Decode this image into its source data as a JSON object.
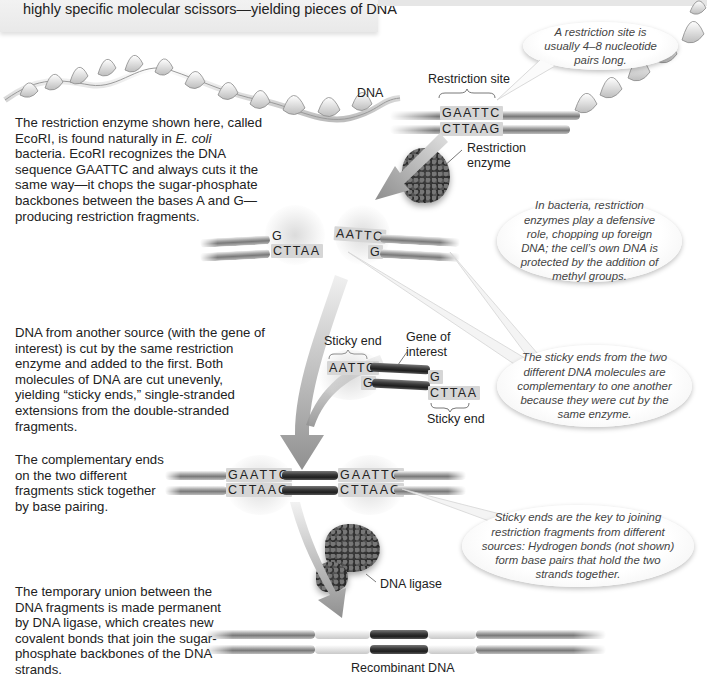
{
  "header": {
    "text": "highly specific molecular scissors—yielding pieces of DNA"
  },
  "callouts": {
    "restriction_site_length": "A restriction site is usually 4–8 nucleotide pairs long.",
    "bacteria_defense": "In bacteria, restriction enzymes play a defensive role, chopping up foreign DNA; the cell’s own DNA is protected by the addition of methyl groups.",
    "complementary_sticky_ends": "The sticky ends from the two different DNA molecules are complementary to one another because they were cut by the same enzyme.",
    "key_to_joining": "Sticky ends are the key to joining restriction fragments from different sources: Hydrogen bonds (not shown) form base pairs that hold the two strands together."
  },
  "steps": [
    {
      "id": 1,
      "text_before_italic": "The restriction enzyme shown here, called EcoRI, is found naturally in ",
      "italic": "E. coli",
      "text_after_italic": " bacteria. EcoRI recognizes the DNA sequence GAATTC and always cuts it the same way—it chops the sugar-phosphate backbones between the bases A and G—producing restriction fragments."
    },
    {
      "id": 2,
      "text": "DNA from another source (with the gene of interest) is cut by the same restriction enzyme and added to the first. Both molecules of DNA are cut unevenly, yielding “sticky ends,” single-stranded extensions from the double-stranded fragments."
    },
    {
      "id": 3,
      "text": "The complementary ends on the two different fragments stick together by base pairing."
    },
    {
      "id": 4,
      "text": "The temporary union between the DNA fragments is made permanent by DNA ligase, which creates new covalent bonds that join the sugar-phosphate backbones of the DNA strands."
    }
  ],
  "labels": {
    "dna": "DNA",
    "restriction_site": "Restriction site",
    "restriction_enzyme_line1": "Restriction",
    "restriction_enzyme_line2": "enzyme",
    "sticky_end_top": "Sticky end",
    "sticky_end_bottom": "Sticky end",
    "gene_of_interest_line1": "Gene of",
    "gene_of_interest_line2": "interest",
    "dna_ligase": "DNA ligase",
    "recombinant_dna": "Recombinant DNA"
  },
  "sequences": {
    "site_top": "GAATTC",
    "site_bottom": "CTTAAG",
    "cut_left_top": "G",
    "cut_left_bottom": "CTTAA",
    "cut_right_top": "AATTC",
    "cut_right_bottom": "G",
    "gene_left_top": "AATTC",
    "gene_left_bottom": "G",
    "gene_right_top": "G",
    "gene_right_bottom": "CTTAA",
    "joined_left_top": "GAATTC",
    "joined_left_bottom": "CTTAAG",
    "joined_right_top": "GAATTC",
    "joined_right_bottom": "CTTAAG"
  },
  "colors": {
    "arrow": "#9a9a9a",
    "strand_gray": "#8c8c8c",
    "gene_dark": "#2a2a2a",
    "bubble_text": "#444444"
  }
}
